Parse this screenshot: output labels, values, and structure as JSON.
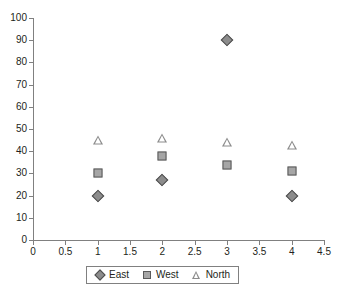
{
  "chart_data": {
    "type": "scatter",
    "title": "",
    "subtitle": "",
    "xlabel": "",
    "ylabel": "",
    "xlim": [
      0,
      4.5
    ],
    "ylim": [
      0,
      100
    ],
    "xticks": [
      "0",
      "0.5",
      "1",
      "1.5",
      "2",
      "2.5",
      "3",
      "3.5",
      "4",
      "4.5"
    ],
    "xtick_values": [
      0,
      0.5,
      1,
      1.5,
      2,
      2.5,
      3,
      3.5,
      4,
      4.5
    ],
    "yticks": [
      "0",
      "10",
      "20",
      "30",
      "40",
      "50",
      "60",
      "70",
      "80",
      "90",
      "100"
    ],
    "ytick_values": [
      0,
      10,
      20,
      30,
      40,
      50,
      60,
      70,
      80,
      90,
      100
    ],
    "grid": false,
    "legend_position": "bottom",
    "x": [
      1,
      2,
      3,
      4
    ],
    "series": [
      {
        "name": "East",
        "marker": "diamond",
        "filled": true,
        "color": "#8c8c8c",
        "edge_color": "#4d4d4d",
        "values": [
          20,
          27,
          90,
          20
        ]
      },
      {
        "name": "West",
        "marker": "square",
        "filled": true,
        "color": "#a6a6a6",
        "edge_color": "#595959",
        "values": [
          30,
          38,
          34,
          31
        ]
      },
      {
        "name": "North",
        "marker": "triangle",
        "filled": false,
        "color": "#8c8c8c",
        "edge_color": "#8c8c8c",
        "values": [
          45,
          46,
          44,
          43
        ]
      }
    ]
  },
  "axis": {
    "line_color": "#808080"
  }
}
